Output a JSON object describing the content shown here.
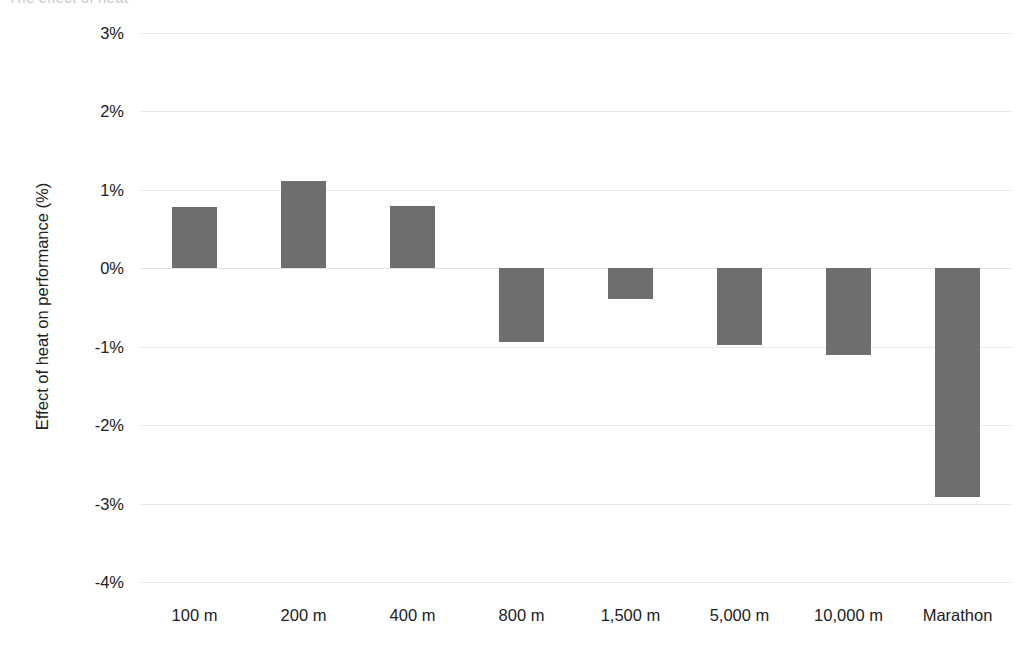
{
  "chart_title_faint": "The effect of heat",
  "chart_data": {
    "type": "bar",
    "title": "",
    "xlabel": "",
    "ylabel": "Effect of heat on performance (%)",
    "categories": [
      "100 m",
      "200 m",
      "400 m",
      "800 m",
      "1,500 m",
      "5,000 m",
      "10,000 m",
      "Marathon"
    ],
    "values": [
      0.78,
      1.11,
      0.79,
      -0.94,
      -0.39,
      -0.98,
      -1.11,
      -2.91
    ],
    "ylim": [
      -4,
      3
    ],
    "ytick_labels": [
      "3%",
      "2%",
      "1%",
      "0%",
      "-1%",
      "-2%",
      "-3%",
      "-4%"
    ],
    "ytick_values": [
      3,
      2,
      1,
      0,
      -1,
      -2,
      -3,
      -4
    ],
    "grid": true,
    "legend": "none",
    "bar_color": "#6e6e6e",
    "gridline_color": "#e9e9ec",
    "background_color": "#ffffff"
  }
}
